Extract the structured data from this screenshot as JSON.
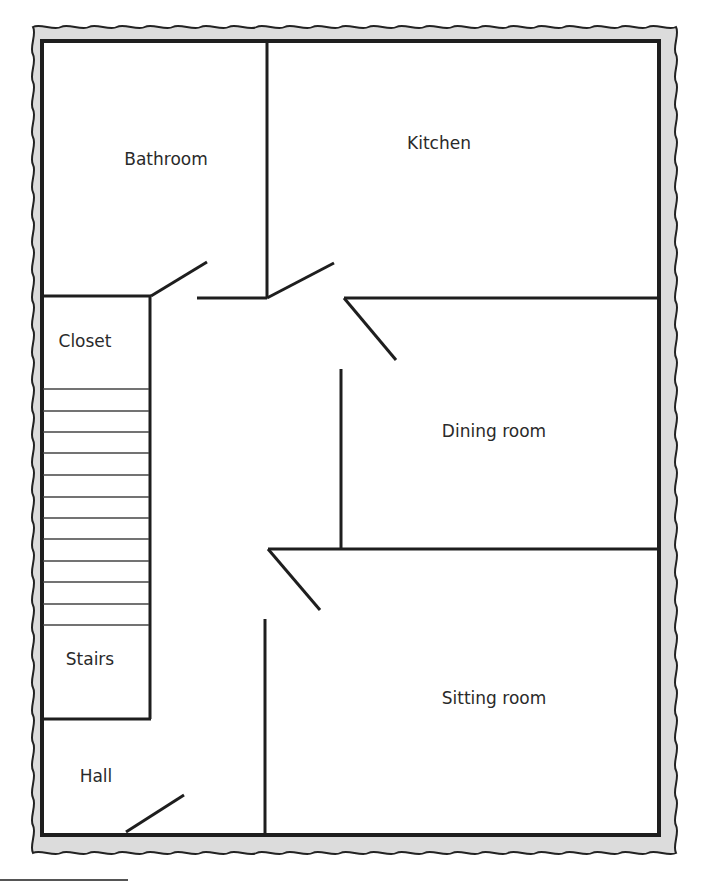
{
  "colors": {
    "frame_fill": "#dcdcdc",
    "wall": "#1e1e1e",
    "stair_line": "#444444",
    "text": "#2a2a2a",
    "background": "#ffffff"
  },
  "rooms": [
    {
      "id": "bathroom",
      "label": "Bathroom",
      "x": 166,
      "y": 159
    },
    {
      "id": "kitchen",
      "label": "Kitchen",
      "x": 439,
      "y": 143
    },
    {
      "id": "closet",
      "label": "Closet",
      "x": 85,
      "y": 341
    },
    {
      "id": "dining-room",
      "label": "Dining room",
      "x": 494,
      "y": 431
    },
    {
      "id": "stairs",
      "label": "Stairs",
      "x": 90,
      "y": 659
    },
    {
      "id": "sitting-room",
      "label": "Sitting room",
      "x": 494,
      "y": 698
    },
    {
      "id": "hall",
      "label": "Hall",
      "x": 96,
      "y": 776
    }
  ],
  "stairs": {
    "step_count": 12,
    "step_lines_y": [
      389,
      411,
      432,
      453,
      475,
      497,
      518,
      539,
      561,
      582,
      604,
      625
    ]
  }
}
